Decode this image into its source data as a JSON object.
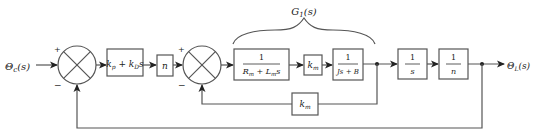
{
  "diagram": {
    "type": "block-diagram",
    "input": {
      "symbol": "Θ",
      "subscript": "c",
      "arg": "(s)"
    },
    "output": {
      "symbol": "Θ",
      "subscript": "L",
      "arg": "(s)"
    },
    "summing_junctions": [
      {
        "id": "sum1",
        "plus_sign": "+",
        "minus_sign": "−"
      },
      {
        "id": "sum2",
        "plus_sign": "+",
        "minus_sign": "−"
      }
    ],
    "blocks": [
      {
        "id": "controller",
        "k1": "k",
        "k1_sub": "p",
        "plus": " + ",
        "k2": "k",
        "k2_sub": "D",
        "var": "s"
      },
      {
        "id": "gear_n",
        "text": "n"
      },
      {
        "id": "electrical",
        "num": "1",
        "den_a": "R",
        "den_a_sub": "m",
        "den_plus": " + ",
        "den_b": "L",
        "den_b_sub": "m",
        "den_var": "s"
      },
      {
        "id": "torque_const",
        "text": "k",
        "sub": "m"
      },
      {
        "id": "mechanical",
        "num": "1",
        "den": "Js + B"
      },
      {
        "id": "integrator",
        "num": "1",
        "den": "s"
      },
      {
        "id": "gear_inv",
        "num": "1",
        "den": "n"
      },
      {
        "id": "back_emf",
        "text": "k",
        "sub": "m"
      }
    ],
    "brace_label": {
      "symbol": "G",
      "sub": "1",
      "arg": "(s)"
    }
  }
}
